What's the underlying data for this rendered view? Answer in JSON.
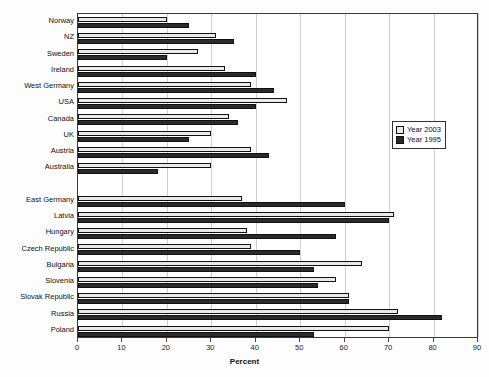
{
  "chart_data": {
    "type": "bar",
    "orientation": "horizontal",
    "title": "",
    "xlabel": "Percent",
    "ylabel": "",
    "xlim": [
      0,
      90
    ],
    "xticks": [
      0,
      10,
      20,
      30,
      40,
      50,
      60,
      70,
      80,
      90
    ],
    "grid": true,
    "legend_position": "right-middle",
    "categories": [
      "Norway",
      "NZ",
      "Sweden",
      "Ireland",
      "West Germany",
      "USA",
      "Canada",
      "UK",
      "Austria",
      "Australia",
      "",
      "East Germany",
      "Latvia",
      "Hungary",
      "Czech Republic",
      "Bulgaria",
      "Slovenia",
      "Slovak Republic",
      "Russia",
      "Poland"
    ],
    "series": [
      {
        "name": "Year 2003",
        "color": "#e9e9e9",
        "values": [
          20,
          31,
          27,
          33,
          39,
          47,
          34,
          30,
          39,
          30,
          null,
          37,
          71,
          38,
          39,
          64,
          58,
          61,
          72,
          70
        ]
      },
      {
        "name": "Year 1995",
        "color": "#2b2b2b",
        "values": [
          25,
          35,
          20,
          40,
          44,
          40,
          36,
          25,
          43,
          18,
          null,
          60,
          70,
          58,
          50,
          53,
          54,
          61,
          82,
          53
        ]
      }
    ]
  },
  "legend": {
    "items": [
      {
        "label": "Year 2003"
      },
      {
        "label": "Year 1995"
      }
    ]
  },
  "axis": {
    "x_label": "Percent",
    "x_ticks": [
      "0",
      "10",
      "20",
      "30",
      "40",
      "50",
      "60",
      "70",
      "80",
      "90"
    ]
  }
}
